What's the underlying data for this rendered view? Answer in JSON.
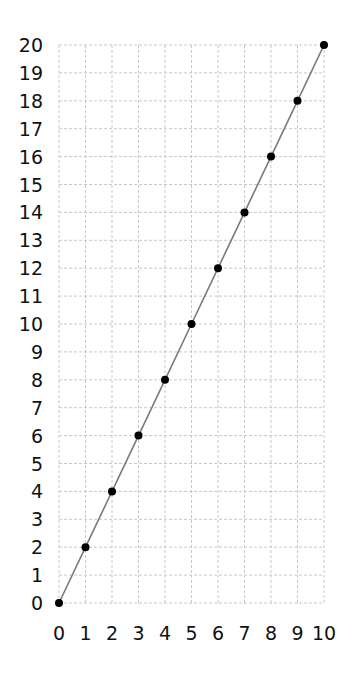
{
  "chart_data": {
    "type": "line",
    "title": "",
    "xlabel": "",
    "ylabel": "",
    "xlim": [
      0,
      10
    ],
    "ylim": [
      0,
      20
    ],
    "grid": true,
    "grid_style": "dashed",
    "x_ticks": [
      0,
      1,
      2,
      3,
      4,
      5,
      6,
      7,
      8,
      9,
      10
    ],
    "y_ticks": [
      0,
      1,
      2,
      3,
      4,
      5,
      6,
      7,
      8,
      9,
      10,
      11,
      12,
      13,
      14,
      15,
      16,
      17,
      18,
      19,
      20
    ],
    "series": [
      {
        "name": "y = 2x",
        "x": [
          0,
          1,
          2,
          3,
          4,
          5,
          6,
          7,
          8,
          9,
          10
        ],
        "y": [
          0,
          2,
          4,
          6,
          8,
          10,
          12,
          14,
          16,
          18,
          20
        ],
        "line_color": "#7a7a7a",
        "marker_color": "#000000",
        "marker": "circle"
      }
    ]
  },
  "colors": {
    "grid": "#c8c8c8",
    "line": "#7a7a7a",
    "marker": "#000000",
    "text": "#111111"
  }
}
